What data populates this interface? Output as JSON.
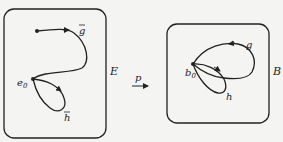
{
  "diagram": {
    "total_space": {
      "label": "E",
      "basepoint": {
        "label": "e",
        "subscript": "0"
      },
      "paths": [
        {
          "name": "g-tilde",
          "label": "g",
          "accent": "tilde"
        },
        {
          "name": "h-tilde",
          "label": "h",
          "accent": "tilde"
        }
      ]
    },
    "base_space": {
      "label": "B",
      "basepoint": {
        "label": "b",
        "subscript": "0"
      },
      "paths": [
        {
          "name": "g",
          "label": "g"
        },
        {
          "name": "h",
          "label": "h"
        }
      ]
    },
    "map": {
      "label": "p"
    },
    "colors": {
      "stroke": "#222222",
      "background": "#f4f4f2"
    }
  }
}
